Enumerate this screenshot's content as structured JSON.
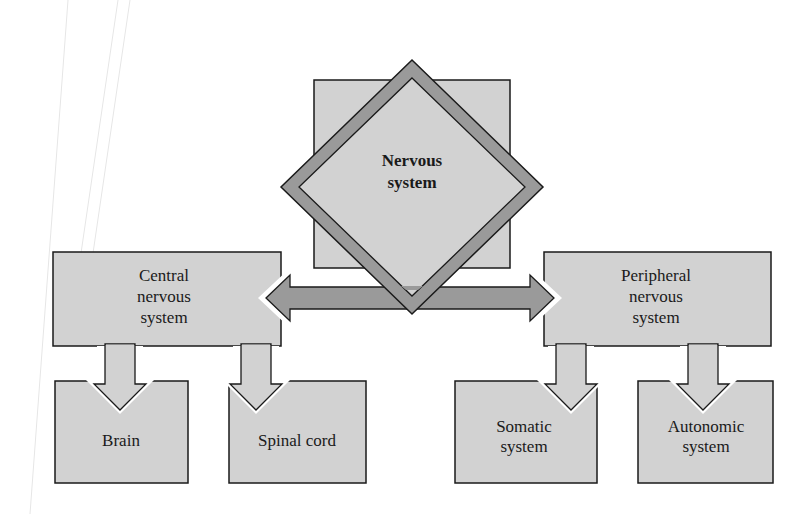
{
  "diagram": {
    "type": "hierarchy",
    "colors": {
      "box_fill": "#d2d2d2",
      "border": "#1a1a1a",
      "arrow_fill": "#9a9a9a",
      "background": "#ffffff"
    },
    "root": {
      "line1": "Nervous",
      "line2": "system"
    },
    "central": {
      "line1": "Central",
      "line2": "nervous",
      "line3": "system",
      "children": {
        "brain": {
          "line1": "Brain"
        },
        "spinal": {
          "line1": "Spinal cord"
        }
      }
    },
    "peripheral": {
      "line1": "Peripheral",
      "line2": "nervous",
      "line3": "system",
      "children": {
        "somatic": {
          "line1": "Somatic",
          "line2": "system"
        },
        "autonomic": {
          "line1": "Autonomic",
          "line2": "system"
        }
      }
    }
  }
}
